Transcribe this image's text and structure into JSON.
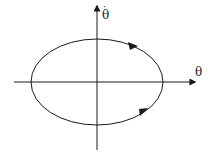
{
  "diagram": {
    "type": "phase-portrait",
    "x_axis_label": "θ",
    "y_axis_label": "θ̇",
    "y_axis_dot": "·",
    "y_axis_base": "θ",
    "orbit": "closed elliptical orbit, clockwise",
    "colors": {
      "stroke": "#1a1a1a",
      "background": "#ffffff"
    }
  }
}
